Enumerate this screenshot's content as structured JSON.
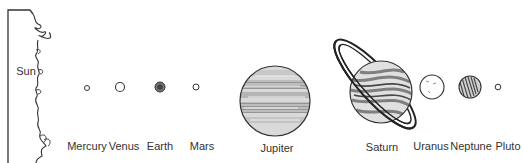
{
  "diagram": {
    "sun": {
      "label": "Sun"
    },
    "planets": [
      {
        "name": "Mercury",
        "label": "Mercury"
      },
      {
        "name": "Venus",
        "label": "Venus"
      },
      {
        "name": "Earth",
        "label": "Earth"
      },
      {
        "name": "Mars",
        "label": "Mars"
      },
      {
        "name": "Jupiter",
        "label": "Jupiter"
      },
      {
        "name": "Saturn",
        "label": "Saturn"
      },
      {
        "name": "Uranus",
        "label": "Uranus"
      },
      {
        "name": "Neptune",
        "label": "Neptune"
      },
      {
        "name": "Pluto",
        "label": "Pluto"
      }
    ],
    "colors": {
      "ink": "#333333",
      "shade": "#9a9a9a",
      "background": "#ffffff"
    }
  }
}
